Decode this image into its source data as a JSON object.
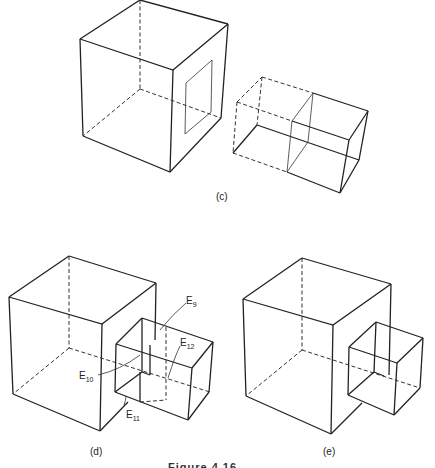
{
  "figure": {
    "panels": [
      {
        "id": "c",
        "label": "(c)"
      },
      {
        "id": "d",
        "label": "(d)"
      },
      {
        "id": "e",
        "label": "(e)"
      }
    ],
    "edge_labels": {
      "e9": {
        "base": "E",
        "sub": "9"
      },
      "e10": {
        "base": "E",
        "sub": "10"
      },
      "e11": {
        "base": "E",
        "sub": "11"
      },
      "e12": {
        "base": "E",
        "sub": "12"
      }
    },
    "caption": "Figure 4.16"
  }
}
